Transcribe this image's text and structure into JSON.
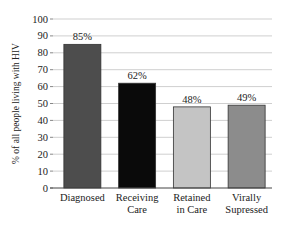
{
  "chart_data": {
    "type": "bar",
    "title": "",
    "xlabel": "",
    "ylabel": "% of all people living with HIV",
    "ylim": [
      0,
      100
    ],
    "yticks": [
      0,
      10,
      20,
      30,
      40,
      50,
      60,
      70,
      80,
      90,
      100
    ],
    "grid": true,
    "legend": "none",
    "categories": [
      [
        "Diagnosed"
      ],
      [
        "Receiving",
        "Care"
      ],
      [
        "Retained",
        "in Care"
      ],
      [
        "Virally",
        "Supressed"
      ]
    ],
    "values": [
      85,
      62,
      48,
      49
    ],
    "data_labels": [
      "85%",
      "62%",
      "48%",
      "49%"
    ],
    "colors": [
      "#4d4d4d",
      "#0a0a0a",
      "#c4c4c4",
      "#8c8c8c"
    ]
  }
}
